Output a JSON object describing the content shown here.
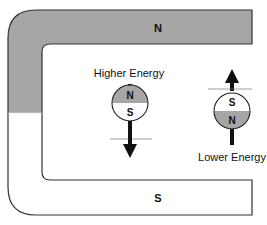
{
  "magnet": {
    "top_pole": "N",
    "bottom_pole": "S",
    "colors": {
      "north_fill": "#a6a6a6",
      "south_fill": "#ffffff",
      "outline": "#333333"
    }
  },
  "dipoles": [
    {
      "label": "Higher Energy",
      "top_pole": "N",
      "bottom_pole": "S",
      "arrow": "down"
    },
    {
      "label": "Lower Energy",
      "top_pole": "S",
      "bottom_pole": "N",
      "arrow": "up"
    }
  ]
}
